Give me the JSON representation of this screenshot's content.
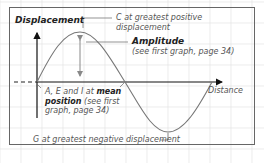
{
  "diagram": {
    "y_axis_label": "Displacement",
    "x_axis_label": "Distance",
    "labels": {
      "c_line1": "C at greatest positive",
      "c_line2": "displacement",
      "amplitude_title": "Amplitude",
      "amplitude_note": "(see first graph, page 34)",
      "mean_line1_prefix": "A, E and I at ",
      "mean_line1_bold": "mean",
      "mean_line2_bold": "position",
      "mean_line2_rest": " (see first",
      "mean_line3": "graph, page 34)",
      "g_label": "G at greatest negative displacement"
    },
    "colors": {
      "border": "#666666",
      "grid": "#e4e4e4",
      "axis": "#111111",
      "curve": "#777777",
      "amplitude_arrow": "#888888",
      "text": "#555555"
    }
  }
}
